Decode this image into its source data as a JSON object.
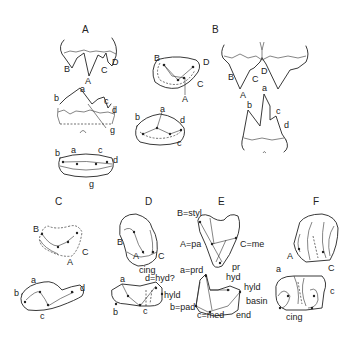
{
  "figure": {
    "panels": [
      {
        "id": "A",
        "title": "A",
        "views": [
          {
            "name": "upper-buccal",
            "labels": [
              "B",
              "A",
              "C",
              "D"
            ]
          },
          {
            "name": "upper-occlusal",
            "labels": [
              "B",
              "D",
              "C",
              "A"
            ]
          },
          {
            "name": "lower-lingual",
            "labels": [
              "a",
              "b",
              "c",
              "d",
              "g"
            ]
          },
          {
            "name": "lower-occlusal-right",
            "labels": [
              "b",
              "a",
              "d",
              "c"
            ]
          },
          {
            "name": "lower-occlusal",
            "labels": [
              "b",
              "a",
              "c",
              "d",
              "g"
            ]
          }
        ]
      },
      {
        "id": "B",
        "title": "B",
        "views": [
          {
            "name": "upper-pair",
            "labels": [
              "B",
              "C",
              "D",
              "A"
            ]
          },
          {
            "name": "lower",
            "labels": [
              "a",
              "b",
              "c",
              "d"
            ]
          }
        ]
      },
      {
        "id": "C",
        "title": "C",
        "views": [
          {
            "name": "upper",
            "labels": [
              "B",
              "C",
              "A"
            ]
          },
          {
            "name": "lower",
            "labels": [
              "a",
              "b",
              "d",
              "c"
            ]
          }
        ]
      },
      {
        "id": "D",
        "title": "D",
        "views": [
          {
            "name": "upper",
            "labels": [
              "B",
              "A",
              "C",
              "cing"
            ]
          },
          {
            "name": "lower",
            "labels": [
              "a",
              "d=hyd?",
              "hyld",
              "b",
              "c"
            ]
          }
        ]
      },
      {
        "id": "E",
        "title": "E",
        "views": [
          {
            "name": "upper",
            "labels": [
              "B=styl",
              "A=pa",
              "C=me",
              "pr"
            ]
          },
          {
            "name": "lower",
            "labels": [
              "a=prd",
              "hyd",
              "hyld",
              "basin",
              "b=pad",
              "c=med",
              "end"
            ]
          }
        ]
      },
      {
        "id": "F",
        "title": "F",
        "views": [
          {
            "name": "upper",
            "labels": [
              "A",
              "C"
            ]
          },
          {
            "name": "lower",
            "labels": [
              "a",
              "c",
              "cing"
            ]
          }
        ]
      }
    ]
  }
}
